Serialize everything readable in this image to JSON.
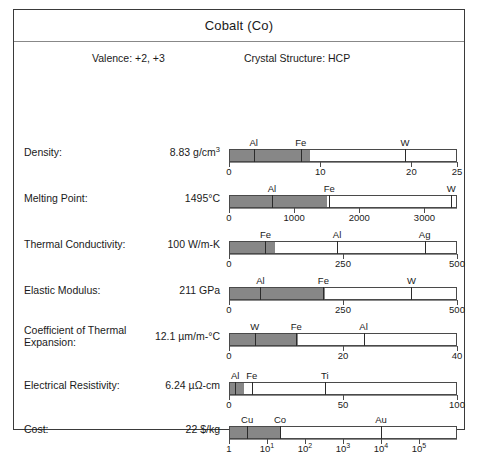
{
  "header": {
    "title": "Cobalt (Co)"
  },
  "meta": {
    "valence": "Valence:  +2, +3",
    "crystal_structure": "Crystal Structure:  HCP"
  },
  "chart_data": {
    "type": "bar",
    "title": "Cobalt (Co)",
    "orientation": "horizontal",
    "subject": "Co",
    "rows": [
      {
        "label": "Density:",
        "value_text": "8.83 g/cm",
        "value_sup": "3",
        "value": 8.83,
        "unit": "g/cm^3",
        "scale": "linear",
        "min": 0,
        "max": 25,
        "ticks": [
          {
            "value": 0,
            "label": "0"
          },
          {
            "value": 10,
            "label": "10"
          },
          {
            "value": 20,
            "label": "20"
          },
          {
            "value": 25,
            "label": "25"
          }
        ],
        "markers": [
          {
            "label": "Al",
            "value": 2.7
          },
          {
            "label": "Fe",
            "value": 7.87
          },
          {
            "label": "W",
            "value": 19.3
          }
        ]
      },
      {
        "label": "Melting Point:",
        "value_text": "1495°C",
        "value_sup": "",
        "value": 1495,
        "unit": "°C",
        "scale": "linear",
        "min": 0,
        "max": 3500,
        "ticks": [
          {
            "value": 0,
            "label": "0"
          },
          {
            "value": 1000,
            "label": "1000"
          },
          {
            "value": 2000,
            "label": "2000"
          },
          {
            "value": 3000,
            "label": "3000"
          }
        ],
        "markers": [
          {
            "label": "Al",
            "value": 660
          },
          {
            "label": "Fe",
            "value": 1538
          },
          {
            "label": "W",
            "value": 3410
          }
        ]
      },
      {
        "label": "Thermal Conductivity:",
        "value_text": "100 W/m-K",
        "value_sup": "",
        "value": 100,
        "unit": "W/m-K",
        "scale": "linear",
        "min": 0,
        "max": 500,
        "ticks": [
          {
            "value": 0,
            "label": "0"
          },
          {
            "value": 250,
            "label": "250"
          },
          {
            "value": 500,
            "label": "500"
          }
        ],
        "markers": [
          {
            "label": "Fe",
            "value": 80
          },
          {
            "label": "Al",
            "value": 237
          },
          {
            "label": "Ag",
            "value": 429
          }
        ]
      },
      {
        "label": "Elastic Modulus:",
        "value_text": "211 GPa",
        "value_sup": "",
        "value": 211,
        "unit": "GPa",
        "scale": "linear",
        "min": 0,
        "max": 500,
        "ticks": [
          {
            "value": 0,
            "label": "0"
          },
          {
            "value": 250,
            "label": "250"
          },
          {
            "value": 500,
            "label": "500"
          }
        ],
        "markers": [
          {
            "label": "Al",
            "value": 69
          },
          {
            "label": "Fe",
            "value": 207
          },
          {
            "label": "W",
            "value": 400
          }
        ]
      },
      {
        "label": "Coefficient of Thermal\nExpansion:",
        "value_text": "12.1 µm/m-°C",
        "value_sup": "",
        "value": 12.1,
        "unit": "µm/m-°C",
        "scale": "linear",
        "min": 0,
        "max": 40,
        "ticks": [
          {
            "value": 0,
            "label": "0"
          },
          {
            "value": 20,
            "label": "20"
          },
          {
            "value": 40,
            "label": "40"
          }
        ],
        "markers": [
          {
            "label": "W",
            "value": 4.5
          },
          {
            "label": "Fe",
            "value": 11.8
          },
          {
            "label": "Al",
            "value": 23.6
          }
        ]
      },
      {
        "label": "Electrical Resistivity:",
        "value_text": "6.24 µΩ-cm",
        "value_sup": "",
        "value": 6.24,
        "unit": "µΩ-cm",
        "scale": "linear",
        "min": 0,
        "max": 100,
        "ticks": [
          {
            "value": 0,
            "label": "0"
          },
          {
            "value": 50,
            "label": "50"
          },
          {
            "value": 100,
            "label": "100"
          }
        ],
        "markers": [
          {
            "label": "Al",
            "value": 2.7
          },
          {
            "label": "Fe",
            "value": 10
          },
          {
            "label": "Ti",
            "value": 42
          }
        ]
      },
      {
        "label": "Cost:",
        "value_text": "22 $/kg",
        "value_sup": "",
        "value": 22,
        "unit": "$/kg",
        "scale": "log",
        "min": 1,
        "max": 1000000,
        "ticks": [
          {
            "value": 1,
            "label": "1",
            "sup": ""
          },
          {
            "value": 10,
            "label": "10",
            "sup": "1"
          },
          {
            "value": 100,
            "label": "10",
            "sup": "2"
          },
          {
            "value": 1000,
            "label": "10",
            "sup": "3"
          },
          {
            "value": 10000,
            "label": "10",
            "sup": "4"
          },
          {
            "value": 100000,
            "label": "10",
            "sup": "5"
          }
        ],
        "markers": [
          {
            "label": "Cu",
            "value": 3
          },
          {
            "label": "Co",
            "value": 22
          },
          {
            "label": "Au",
            "value": 10000
          }
        ]
      }
    ]
  },
  "colors": {
    "fill": "#878787",
    "border": "#3a3a3a",
    "axis": "#8a8a8a"
  }
}
